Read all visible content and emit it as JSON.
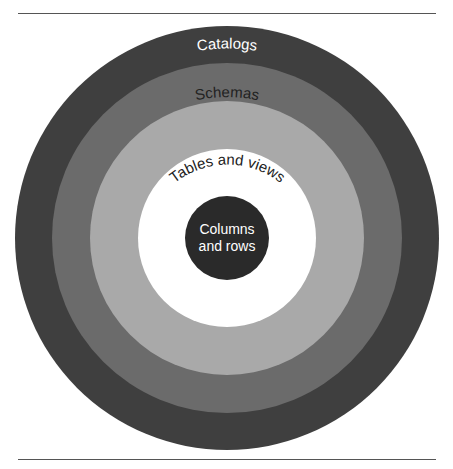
{
  "diagram": {
    "layers": [
      {
        "label": "Clusters",
        "color": "#3f3f3f",
        "text_color": "#ffffff"
      },
      {
        "label": "Catalogs",
        "color": "#6b6b6b",
        "text_color": "#ffffff"
      },
      {
        "label": "Schemas",
        "color": "#a9a9a9",
        "text_color": "#222222"
      },
      {
        "label": "Tables and views",
        "color": "#ffffff",
        "text_color": "#222222"
      },
      {
        "label_line1": "Columns",
        "label_line2": "and rows",
        "color": "#2a2a2a",
        "text_color": "#ffffff"
      }
    ]
  }
}
